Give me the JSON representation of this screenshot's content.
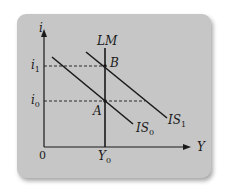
{
  "diagram": {
    "axes": {
      "y_label": "i",
      "x_label": "Y",
      "origin_label": "0"
    },
    "curves": [
      {
        "id": "LM",
        "label": "LM",
        "type": "vertical"
      },
      {
        "id": "IS0",
        "label_main": "IS",
        "label_sub": "0",
        "type": "downward-sloping"
      },
      {
        "id": "IS1",
        "label_main": "IS",
        "label_sub": "1",
        "type": "downward-sloping"
      }
    ],
    "points": [
      {
        "id": "A",
        "label": "A"
      },
      {
        "id": "B",
        "label": "B"
      }
    ],
    "y_ticks": [
      {
        "main": "i",
        "sub": "1"
      },
      {
        "main": "i",
        "sub": "0"
      }
    ],
    "x_ticks": [
      {
        "main": "Y",
        "sub": "0"
      }
    ],
    "colors": {
      "panel": "#c6c6c6",
      "lines": "#1a1a1a",
      "background": "#ffffff"
    }
  }
}
